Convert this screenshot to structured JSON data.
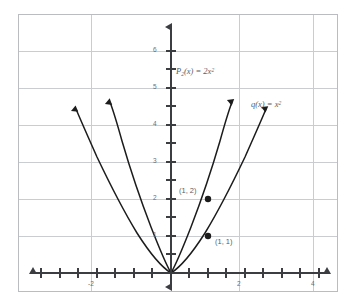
{
  "chart_data": {
    "type": "line",
    "title": "",
    "xlabel": "",
    "ylabel": "",
    "xlim": [
      -2.75,
      4.5
    ],
    "ylim": [
      -0.75,
      7.0
    ],
    "grid": true,
    "grid_step_x": 2,
    "grid_step_y": 1,
    "legend_position": "inline-annotations",
    "x_ticks": [
      -2,
      2,
      4
    ],
    "x_tick_labels": [
      "-2",
      "2",
      "4"
    ],
    "x_minor_tick_step": 0.5,
    "y_ticks": [
      1,
      2,
      3,
      4,
      5,
      6
    ],
    "y_tick_labels": [
      "1",
      "2",
      "3",
      "4",
      "5",
      "6"
    ],
    "y_minor_tick_step": 0.5,
    "series": [
      {
        "name": "P2(x) = 2x^2",
        "label_html": "P<sub>2</sub>(x) = 2x<sup>2</sup>",
        "formula": "y = 2*x^2",
        "color": "#1c1c1c",
        "arrow_ends": true,
        "x_range": [
          -1.82,
          1.82
        ],
        "points": [
          {
            "x": -1.8,
            "y": 6.48
          },
          {
            "x": -1.5,
            "y": 4.5
          },
          {
            "x": -1.0,
            "y": 2.0
          },
          {
            "x": -0.5,
            "y": 0.5
          },
          {
            "x": 0.0,
            "y": 0.0
          },
          {
            "x": 0.5,
            "y": 0.5
          },
          {
            "x": 1.0,
            "y": 2.0
          },
          {
            "x": 1.5,
            "y": 4.5
          },
          {
            "x": 1.8,
            "y": 6.48
          }
        ]
      },
      {
        "name": "q(x) = x^2",
        "label_html": "q(x) = x<sup>2</sup>",
        "formula": "y = x^2",
        "color": "#1c1c1c",
        "arrow_ends": true,
        "x_range": [
          -2.55,
          2.55
        ],
        "points": [
          {
            "x": -2.55,
            "y": 6.5
          },
          {
            "x": -2.0,
            "y": 4.0
          },
          {
            "x": -1.5,
            "y": 2.25
          },
          {
            "x": -1.0,
            "y": 1.0
          },
          {
            "x": -0.5,
            "y": 0.25
          },
          {
            "x": 0.0,
            "y": 0.0
          },
          {
            "x": 0.5,
            "y": 0.25
          },
          {
            "x": 1.0,
            "y": 1.0
          },
          {
            "x": 1.5,
            "y": 2.25
          },
          {
            "x": 2.0,
            "y": 4.0
          },
          {
            "x": 2.55,
            "y": 6.5
          }
        ]
      }
    ],
    "annotations": [
      {
        "name": "point-1-2",
        "text": "(1, 2)",
        "x": 1,
        "y": 2,
        "marker": true,
        "series": "P2(x) = 2x^2"
      },
      {
        "name": "point-1-1",
        "text": "(1, 1)",
        "x": 1,
        "y": 1,
        "marker": true,
        "series": "q(x) = x^2"
      }
    ]
  },
  "labels": {
    "p_function": "P2(x) = 2x2",
    "q_function": "q(x) = x2",
    "point_upper": "(1, 2)",
    "point_lower": "(1, 1)"
  },
  "axis": {
    "y_tick_6": "6",
    "y_tick_5": "5",
    "y_tick_4": "4",
    "y_tick_3": "3",
    "y_tick_2": "2",
    "y_tick_1": "1",
    "x_tick_neg2": "-2",
    "x_tick_2": "2",
    "x_tick_4": "4"
  },
  "colors": {
    "curve": "#1c1c1c",
    "axis": "#3b3d41",
    "grid": "#c9ccd1",
    "border": "#b9bcc0",
    "text": "#5a5d63"
  }
}
